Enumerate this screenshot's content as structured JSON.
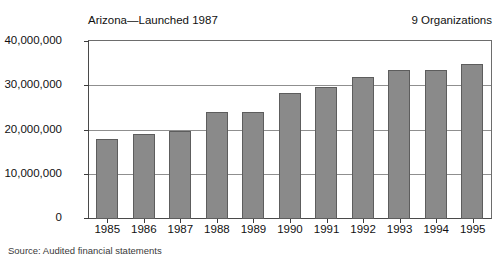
{
  "header": {
    "title_left": "Arizona—Launched 1987",
    "title_right": "9 Organizations"
  },
  "footer": {
    "source": "Source: Audited financial statements"
  },
  "chart_data": {
    "type": "bar",
    "title": "Arizona—Launched 1987",
    "subtitle": "9 Organizations",
    "xlabel": "",
    "ylabel": "",
    "categories": [
      "1985",
      "1986",
      "1987",
      "1988",
      "1989",
      "1990",
      "1991",
      "1992",
      "1993",
      "1994",
      "1995"
    ],
    "values": [
      18000000,
      19200000,
      20000000,
      24100000,
      24100000,
      28400000,
      29800000,
      32200000,
      33600000,
      33600000,
      35000000
    ],
    "ylim": [
      0,
      40000000
    ],
    "yticks": [
      0,
      10000000,
      20000000,
      30000000,
      40000000
    ],
    "ytick_labels": [
      "0",
      "10,000,000",
      "20,000,000",
      "30,000,000",
      "40,000,000"
    ],
    "grid": true,
    "legend": "none",
    "bar_color": "#8a8a8a",
    "bar_edge_color": "#5d5d5d",
    "note": "Source: Audited financial statements"
  }
}
